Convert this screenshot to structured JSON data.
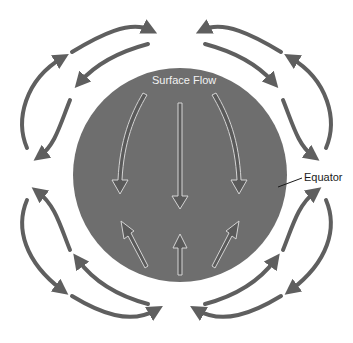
{
  "diagram": {
    "labels": {
      "surface_flow": "Surface Flow",
      "equator": "Equator"
    },
    "colors": {
      "globe": "#6e6e6e",
      "circulation_arrows": "#5f5f5f",
      "flow_arrow_outline": "#cfcfcf",
      "background": "#ffffff",
      "equator_leader": "#1a1a1a"
    },
    "globe": {
      "cx": 180,
      "cy": 175,
      "r": 107
    },
    "surface_flow_arrows": [
      {
        "id": "north-left",
        "direction": "down"
      },
      {
        "id": "north-center",
        "direction": "down"
      },
      {
        "id": "north-right",
        "direction": "down"
      },
      {
        "id": "south-left",
        "direction": "up"
      },
      {
        "id": "south-center",
        "direction": "up"
      },
      {
        "id": "south-right",
        "direction": "up"
      }
    ],
    "circulation_cells": [
      {
        "id": "cell-upper-left",
        "quadrant": "upper-left",
        "arrows": 4
      },
      {
        "id": "cell-upper-right",
        "quadrant": "upper-right",
        "arrows": 4
      },
      {
        "id": "cell-lower-left",
        "quadrant": "lower-left",
        "arrows": 4
      },
      {
        "id": "cell-lower-right",
        "quadrant": "lower-right",
        "arrows": 4
      }
    ]
  }
}
